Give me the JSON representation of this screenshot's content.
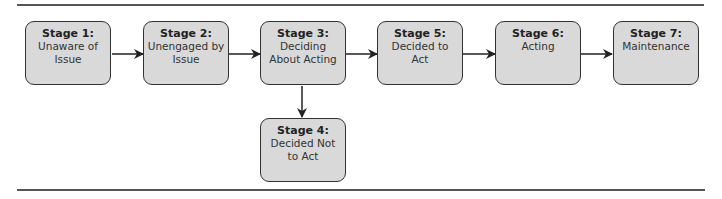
{
  "diagram": {
    "colors": {
      "box_fill": "#d9d9d9",
      "box_border": "#333333",
      "arrow": "#222222",
      "rule": "#555555"
    },
    "stages": [
      {
        "id": "stage1",
        "title": "Stage 1:",
        "desc": "Unaware of\nIssue"
      },
      {
        "id": "stage2",
        "title": "Stage 2:",
        "desc": "Unengaged by\nIssue"
      },
      {
        "id": "stage3",
        "title": "Stage 3:",
        "desc": "Deciding\nAbout Acting"
      },
      {
        "id": "stage4",
        "title": "Stage 4:",
        "desc": "Decided Not\nto Act"
      },
      {
        "id": "stage5",
        "title": "Stage 5:",
        "desc": "Decided to\nAct"
      },
      {
        "id": "stage6",
        "title": "Stage 6:",
        "desc": "Acting"
      },
      {
        "id": "stage7",
        "title": "Stage 7:",
        "desc": "Maintenance"
      }
    ],
    "edges": [
      {
        "from": "stage1",
        "to": "stage2"
      },
      {
        "from": "stage2",
        "to": "stage3"
      },
      {
        "from": "stage3",
        "to": "stage5"
      },
      {
        "from": "stage3",
        "to": "stage4"
      },
      {
        "from": "stage5",
        "to": "stage6"
      },
      {
        "from": "stage6",
        "to": "stage7"
      }
    ]
  }
}
